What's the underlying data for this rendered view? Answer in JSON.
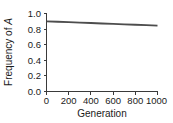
{
  "chart_data": {
    "type": "line",
    "title": "",
    "xlabel": "Generation",
    "ylabel_parts": {
      "main": "Frequency of ",
      "italic": "A"
    },
    "ylabel": "Frequency of A",
    "xlim": [
      0,
      1000
    ],
    "ylim": [
      0.0,
      1.0
    ],
    "xticks": [
      0,
      200,
      400,
      600,
      800,
      1000
    ],
    "xtick_labels": [
      "0",
      "200",
      "400",
      "600",
      "800",
      "1000"
    ],
    "yticks": [
      0.0,
      0.2,
      0.4,
      0.6,
      0.8,
      1.0
    ],
    "ytick_labels": [
      "0.0",
      "0.2",
      "0.4",
      "0.6",
      "0.8",
      "1.0"
    ],
    "grid": false,
    "legend": false,
    "legend_position": "none",
    "series": [
      {
        "name": "Frequency of A",
        "color": "#4d4d4d",
        "x": [
          0,
          100,
          200,
          300,
          400,
          500,
          600,
          700,
          800,
          900,
          1000
        ],
        "values": [
          0.9,
          0.894,
          0.889,
          0.883,
          0.878,
          0.872,
          0.867,
          0.861,
          0.856,
          0.85,
          0.845
        ]
      }
    ]
  },
  "style": {
    "axis_color": "#3a3a3a",
    "text_color": "#1a1a1a",
    "background": "#ffffff"
  }
}
